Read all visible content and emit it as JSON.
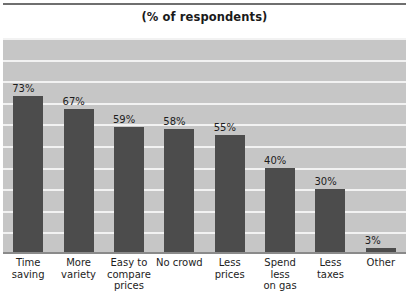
{
  "chart_data": {
    "type": "bar",
    "title": "(% of respondents)",
    "xlabel": "",
    "ylabel": "",
    "ylim": [
      0,
      100
    ],
    "grid": true,
    "gridline_step": 10,
    "legend": "none",
    "value_suffix": "%",
    "categories": [
      "Time saving",
      "More variety",
      "Easy to compare prices",
      "No crowd",
      "Less prices",
      "Spend less on gas",
      "Less taxes",
      "Other"
    ],
    "category_lines": [
      [
        "Time",
        "saving"
      ],
      [
        "More",
        "variety"
      ],
      [
        "Easy to",
        "compare",
        "prices"
      ],
      [
        "No crowd"
      ],
      [
        "Less",
        "prices"
      ],
      [
        "Spend",
        "less",
        "on gas"
      ],
      [
        "Less",
        "taxes"
      ],
      [
        "Other"
      ]
    ],
    "values": [
      73,
      67,
      59,
      58,
      55,
      40,
      30,
      3
    ],
    "value_labels": [
      "73%",
      "67%",
      "59%",
      "58%",
      "55%",
      "40%",
      "30%",
      "3%"
    ],
    "colors": {
      "bar": "#4c4c4c",
      "plot_background": "#c6c6c6",
      "gridline": "#f2f2f2",
      "page_background": "#ffffff",
      "text": "#1d1d1d",
      "axis_rule": "#8a8a8a"
    }
  }
}
